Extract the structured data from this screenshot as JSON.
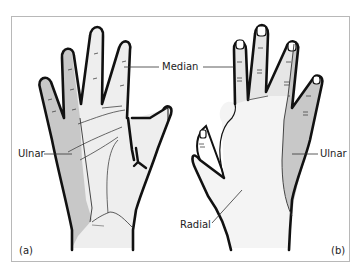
{
  "figure": {
    "panels": [
      {
        "id": "a",
        "label": "(a)",
        "view": "palm"
      },
      {
        "id": "b",
        "label": "(b)",
        "view": "dorsum"
      }
    ],
    "labels": {
      "median": "Median",
      "ulnar_a": "Ulnar",
      "ulnar_b": "Ulnar",
      "radial": "Radial"
    },
    "colors": {
      "ulnar_region": "#c8c8c8",
      "median_region": "#ececec",
      "radial_region": "#f4f4f4",
      "outline": "#111111",
      "frame": "#b8b8b8"
    }
  }
}
